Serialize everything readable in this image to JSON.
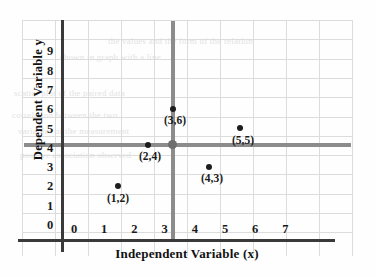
{
  "chart_data": {
    "type": "scatter",
    "title": "",
    "xlabel": "Independent Variable (x)",
    "ylabel": "Dependent Variable  y",
    "x": [
      1,
      2,
      3,
      4,
      5
    ],
    "y": [
      2,
      4,
      6,
      3,
      5
    ],
    "point_labels": [
      "(1,2)",
      "(2,4)",
      "(3,6)",
      "(4,3)",
      "(5,5)"
    ],
    "xlim": [
      0,
      7
    ],
    "ylim": [
      0,
      9
    ],
    "xticks": [
      "0",
      "1",
      "2",
      "3",
      "4",
      "5",
      "6",
      "7"
    ],
    "yticks": [
      "9",
      "8",
      "7",
      "6",
      "5",
      "4",
      "3",
      "2",
      "1",
      "0"
    ],
    "grid": true,
    "legend": "none",
    "mean_lines": {
      "x_mean": 3.2,
      "y_mean": 4.6,
      "color": "#8c8c8c"
    },
    "colors": {
      "point": "#1d1d1d",
      "axis": "#3a3a3a",
      "grid": "#dcdcdc",
      "mean": "#8c8c8c"
    }
  },
  "points": [
    {
      "label": "(1,2)",
      "x": 1,
      "y": 2,
      "px": 118,
      "py": 186,
      "lx": 118,
      "ly": 192
    },
    {
      "label": "(2,4)",
      "x": 2,
      "y": 4,
      "px": 148,
      "py": 145,
      "lx": 150,
      "ly": 150
    },
    {
      "label": "(3,6)",
      "x": 3,
      "y": 6,
      "px": 173,
      "py": 109,
      "lx": 175,
      "ly": 114
    },
    {
      "label": "(4,3)",
      "x": 4,
      "y": 3,
      "px": 209,
      "py": 167,
      "lx": 212,
      "ly": 172
    },
    {
      "label": "(5,5)",
      "x": 5,
      "y": 5,
      "px": 240,
      "py": 128,
      "lx": 243,
      "ly": 134
    }
  ],
  "ghost_text": [
    {
      "text": "the values and the form of the relation",
      "x": 108,
      "y": 36
    },
    {
      "text": "shown in graph with a line",
      "x": 60,
      "y": 52
    },
    {
      "text": "scatter plot of the paired data",
      "x": 14,
      "y": 88
    },
    {
      "text": "correlation between the two",
      "x": 12,
      "y": 110
    },
    {
      "text": "variables of the measurement",
      "x": 18,
      "y": 126
    },
    {
      "text": "positive association observed",
      "x": 20,
      "y": 150
    }
  ]
}
